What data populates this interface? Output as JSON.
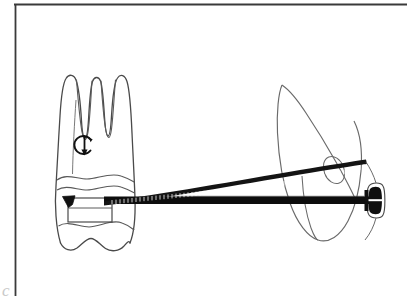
{
  "figure": {
    "domain": "medical-illustration",
    "background_color": "#ffffff",
    "ink_color": "#1a1a1a",
    "outline_color": "#4a4a4a",
    "frame": {
      "name": "page-border",
      "top_rule": {
        "x1": 14,
        "y1": 4,
        "x2": 407,
        "y2": 4,
        "width": 1.6,
        "color": "#3a3a3a"
      },
      "left_rule": {
        "x1": 15,
        "y1": 4,
        "x2": 15,
        "y2": 296,
        "width": 1.6,
        "color": "#3a3a3a"
      }
    },
    "elements": {
      "left_tooth_label": "left molar tooth outline",
      "right_tooth_label": "right tooth outline",
      "rotation_symbol_label": "rotation torque arrow",
      "bone_block_label": "rectangular bone block",
      "black_arrow_label": "direction arrow",
      "threaded_rod_label": "threaded extraction rod",
      "solid_rod_label": "solid instrument shaft",
      "handle_label": "instrument handle knob"
    },
    "geometry": {
      "left_tooth": {
        "crown_top_y": 76,
        "root_tips_y": 76,
        "cej_y": 178,
        "base_y": 243,
        "left_x": 54,
        "right_x": 136
      },
      "right_tooth": {
        "apex_x": 282,
        "apex_y": 84,
        "base_y": 240,
        "left_x": 272,
        "right_x": 364
      },
      "rod": {
        "solid_y": 200,
        "start_x": 104,
        "end_x": 370,
        "thickness": 7
      },
      "threaded_rod": {
        "start_x": 104,
        "start_y": 200,
        "end_x": 366,
        "end_y": 161,
        "thickness": 6,
        "thread_count": 62
      },
      "bone_block": {
        "x": 68,
        "y": 198,
        "width": 44,
        "height": 24
      },
      "rotation_symbol": {
        "cx": 82,
        "cy": 145,
        "radius": 9
      },
      "handle": {
        "cx": 374,
        "cy": 200,
        "width": 14,
        "height": 26
      }
    }
  },
  "artifact": {
    "bottom_left_glyph": "c"
  }
}
